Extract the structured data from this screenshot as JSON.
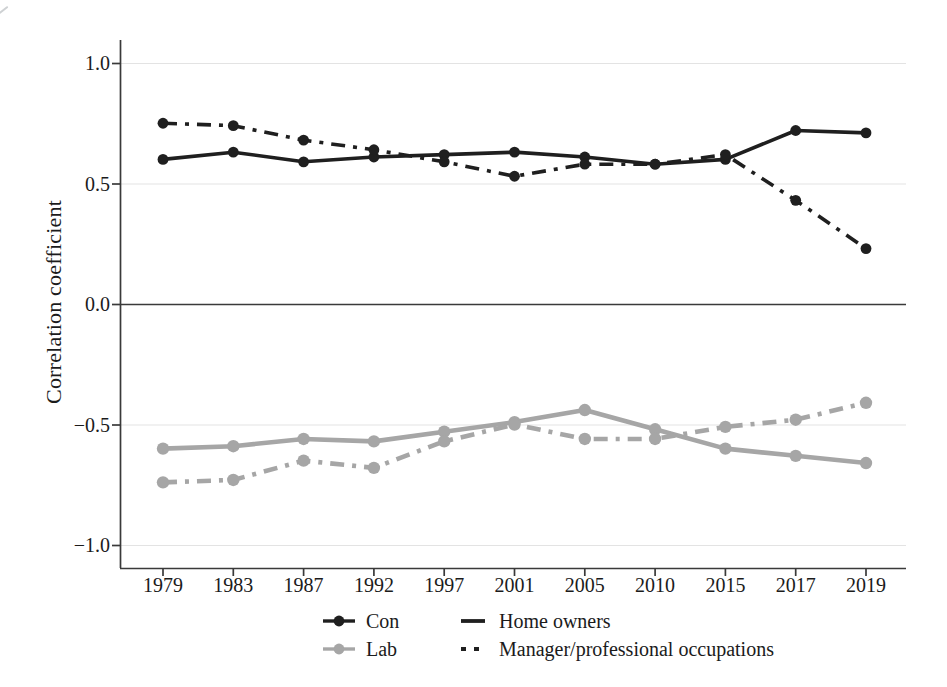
{
  "chart_data": {
    "type": "line",
    "title": "",
    "xlabel": "",
    "ylabel": "Correlation coefficient",
    "x_scale": "categorical-even-spacing",
    "x_categories": [
      "1979",
      "1983",
      "1987",
      "1992",
      "1997",
      "2001",
      "2005",
      "2010",
      "2015",
      "2017",
      "2019"
    ],
    "y_ticks": [
      {
        "label": "1.0",
        "value": 1.0
      },
      {
        "label": "0.5",
        "value": 0.5
      },
      {
        "label": "0.0",
        "value": 0.0
      },
      {
        "label": "−0.5",
        "value": -0.5
      },
      {
        "label": "−1.0",
        "value": -1.0
      }
    ],
    "ylim": [
      -1.1,
      1.1
    ],
    "grid": "horizontal-light",
    "zero_line": true,
    "legend_position": "bottom",
    "colors": {
      "con": "#1f1f1f",
      "lab": "#a6a6a6",
      "grid": "#e3e3e3",
      "axis": "#3a3a3a",
      "text": "#1b1b1b"
    },
    "series": [
      {
        "name": "Lab – Home owners",
        "party": "Lab",
        "measure": "Home owners",
        "color": "#a6a6a6",
        "style": "solid",
        "marker": "circle",
        "values": [
          -0.6,
          -0.59,
          -0.56,
          -0.57,
          -0.53,
          -0.49,
          -0.44,
          -0.52,
          -0.6,
          -0.63,
          -0.66
        ]
      },
      {
        "name": "Lab – Manager/professional occupations",
        "party": "Lab",
        "measure": "Manager/professional occupations",
        "color": "#a6a6a6",
        "style": "dash-dot",
        "marker": "circle",
        "values": [
          -0.74,
          -0.73,
          -0.65,
          -0.68,
          -0.57,
          -0.5,
          -0.56,
          -0.56,
          -0.51,
          -0.48,
          -0.41
        ]
      },
      {
        "name": "Con – Home owners",
        "party": "Con",
        "measure": "Home owners",
        "color": "#1f1f1f",
        "style": "solid",
        "marker": "circle",
        "values": [
          0.6,
          0.63,
          0.59,
          0.61,
          0.62,
          0.63,
          0.61,
          0.58,
          0.6,
          0.72,
          0.71
        ]
      },
      {
        "name": "Con – Manager/professional occupations",
        "party": "Con",
        "measure": "Manager/professional occupations",
        "color": "#1f1f1f",
        "style": "dash-dot",
        "marker": "circle",
        "values": [
          0.75,
          0.74,
          0.68,
          0.64,
          0.59,
          0.53,
          0.58,
          0.58,
          0.62,
          0.43,
          0.23
        ]
      }
    ],
    "legend": {
      "party_items": [
        {
          "label": "Con",
          "color": "#1f1f1f"
        },
        {
          "label": "Lab",
          "color": "#a6a6a6"
        }
      ],
      "style_items": [
        {
          "label": "Home owners",
          "style": "solid"
        },
        {
          "label": "Manager/professional occupations",
          "style": "dash-dot"
        }
      ]
    }
  }
}
